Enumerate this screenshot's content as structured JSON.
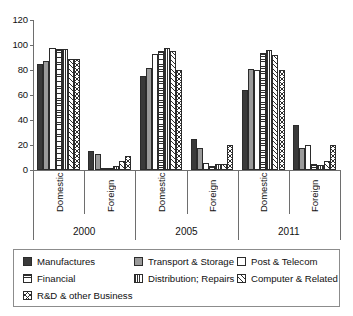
{
  "chart_data": {
    "type": "bar",
    "title": "",
    "subtitle": "",
    "xlabel": "",
    "ylabel": "",
    "ylim": [
      0,
      120
    ],
    "yticks": [
      "0",
      "20",
      "40",
      "60",
      "80",
      "100",
      "120"
    ],
    "grid": false,
    "legend_position": "bottom",
    "categories": [
      "Domestic",
      "Foreign",
      "Domestic",
      "Foreign",
      "Domestic",
      "Foreign"
    ],
    "group_labels": [
      "2000",
      "2005",
      "2011"
    ],
    "series": [
      {
        "name": "Manufactures",
        "pattern": "solid-dark",
        "values": [
          85,
          15,
          75,
          25,
          64,
          36
        ]
      },
      {
        "name": "Transport & Storage",
        "pattern": "solid-gray",
        "values": [
          87,
          13,
          82,
          18,
          81,
          18
        ]
      },
      {
        "name": "Post & Telecom",
        "pattern": "empty",
        "values": [
          98,
          2,
          93,
          6,
          80,
          20
        ]
      },
      {
        "name": "Financial",
        "pattern": "horizontal-lines",
        "values": [
          97,
          2,
          95,
          3,
          94,
          5
        ]
      },
      {
        "name": "Distribution; Repairs",
        "pattern": "vertical-lines",
        "values": [
          97,
          3,
          98,
          5,
          96,
          4
        ]
      },
      {
        "name": "Computer & Related",
        "pattern": "diagonal-hatch",
        "values": [
          89,
          7,
          95,
          5,
          92,
          7
        ]
      },
      {
        "name": "R&D & other Business",
        "pattern": "cross-hatch",
        "values": [
          89,
          11,
          80,
          20,
          80,
          20
        ]
      }
    ]
  },
  "legend": {
    "items": [
      {
        "label": "Manufactures",
        "pattern": "solid-dark"
      },
      {
        "label": "Transport & Storage",
        "pattern": "solid-gray"
      },
      {
        "label": "Post & Telecom",
        "pattern": "empty"
      },
      {
        "label": "Financial",
        "pattern": "horizontal-lines"
      },
      {
        "label": "Distribution; Repairs",
        "pattern": "vertical-lines"
      },
      {
        "label": "Computer & Related",
        "pattern": "diagonal-hatch"
      },
      {
        "label": "R&D & other Business",
        "pattern": "cross-hatch"
      }
    ]
  },
  "colors": {
    "dark": "#3a3a3a",
    "gray": "#9a9a9a",
    "outline": "#2b2b2b",
    "axis": "#6e6e6e",
    "text": "#111111",
    "background": "#ffffff"
  }
}
